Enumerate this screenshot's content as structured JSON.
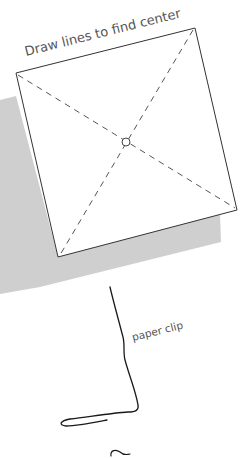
{
  "diagram": {
    "title_label": "Draw lines to find center",
    "clip_label": "paper clip",
    "colors": {
      "background": "#ffffff",
      "shadow": "#cfcfcf",
      "paper_fill": "#ffffff",
      "outline": "#333333",
      "dash": "#555555",
      "text": "#555555",
      "clip": "#1a1a1a"
    },
    "paper": {
      "corners": {
        "top_left": [
          16,
          73
        ],
        "top_right": [
          195,
          28
        ],
        "bottom_right": [
          237,
          210
        ],
        "bottom_left": [
          58,
          257
        ]
      },
      "center_mark": [
        126,
        142
      ]
    },
    "shadow": {
      "corners": [
        [
          0,
          100
        ],
        [
          16,
          96
        ],
        [
          58,
          257
        ],
        [
          220,
          214
        ],
        [
          220,
          242
        ],
        [
          40,
          287
        ]
      ]
    }
  }
}
